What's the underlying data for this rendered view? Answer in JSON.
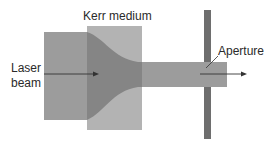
{
  "diagram": {
    "labels": {
      "kerr_medium": "Kerr medium",
      "laser_beam_line1": "Laser",
      "laser_beam_line2": "beam",
      "aperture": "Aperture"
    },
    "elements": [
      {
        "id": "input-beam",
        "kind": "wide beam region"
      },
      {
        "id": "kerr-medium",
        "kind": "nonlinear crystal block"
      },
      {
        "id": "focused-beam",
        "kind": "self-focused beam taper"
      },
      {
        "id": "output-beam",
        "kind": "narrow beam"
      },
      {
        "id": "aperture-plate",
        "kind": "hard aperture"
      },
      {
        "id": "propagation-arrow",
        "kind": "arrow"
      }
    ],
    "colors": {
      "kerr_medium": "#b0b0b0",
      "beam": "#9a9a9a",
      "beam_in_medium": "#838383",
      "aperture": "#6e6e6e",
      "arrow": "#333333",
      "text": "#2a2a2a"
    }
  }
}
